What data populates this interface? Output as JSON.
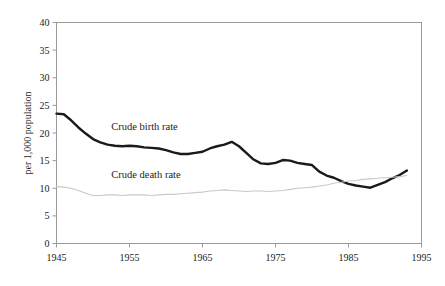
{
  "chart_data": {
    "type": "line",
    "title": "",
    "xlabel": "",
    "ylabel": "per 1,000 population",
    "xlim": [
      1945,
      1995
    ],
    "ylim": [
      0,
      40
    ],
    "grid": false,
    "legend_position": "inline-annotation",
    "x_ticks": [
      "1945",
      "1955",
      "1965",
      "1975",
      "1985",
      "1995"
    ],
    "x_tick_values": [
      1945,
      1955,
      1965,
      1975,
      1985,
      1995
    ],
    "y_ticks": [
      "0",
      "5",
      "10",
      "15",
      "20",
      "25",
      "30",
      "35",
      "40"
    ],
    "y_tick_values": [
      0,
      5,
      10,
      15,
      20,
      25,
      30,
      35,
      40
    ],
    "x": [
      1945,
      1946,
      1947,
      1948,
      1949,
      1950,
      1951,
      1952,
      1953,
      1954,
      1955,
      1956,
      1957,
      1958,
      1959,
      1960,
      1961,
      1962,
      1963,
      1964,
      1965,
      1966,
      1967,
      1968,
      1969,
      1970,
      1971,
      1972,
      1973,
      1974,
      1975,
      1976,
      1977,
      1978,
      1979,
      1980,
      1981,
      1982,
      1983,
      1984,
      1985,
      1986,
      1987,
      1988,
      1989,
      1990,
      1991,
      1992,
      1993
    ],
    "series": [
      {
        "name": "Crude birth rate",
        "color": "#1a1a1a",
        "width": 2.4,
        "label_x": 1952.5,
        "label_y": 20.6,
        "values": [
          23.5,
          23.4,
          22.3,
          21.0,
          19.9,
          18.9,
          18.3,
          17.9,
          17.7,
          17.6,
          17.7,
          17.6,
          17.4,
          17.3,
          17.2,
          16.9,
          16.5,
          16.2,
          16.2,
          16.4,
          16.6,
          17.2,
          17.6,
          17.9,
          18.4,
          17.6,
          16.4,
          15.2,
          14.5,
          14.4,
          14.6,
          15.1,
          15.0,
          14.6,
          14.4,
          14.2,
          13.0,
          12.3,
          11.9,
          11.3,
          10.8,
          10.5,
          10.3,
          10.1,
          10.6,
          11.1,
          11.8,
          12.4,
          13.2
        ]
      },
      {
        "name": "Crude death rate",
        "color": "#c9c9c9",
        "width": 1.1,
        "label_x": 1952.5,
        "label_y": 11.9,
        "values": [
          10.3,
          10.2,
          10.0,
          9.6,
          9.1,
          8.7,
          8.7,
          8.8,
          8.8,
          8.7,
          8.8,
          8.8,
          8.8,
          8.7,
          8.8,
          8.9,
          8.9,
          9.0,
          9.1,
          9.2,
          9.3,
          9.5,
          9.6,
          9.7,
          9.6,
          9.5,
          9.4,
          9.5,
          9.5,
          9.4,
          9.5,
          9.6,
          9.8,
          10.0,
          10.1,
          10.2,
          10.4,
          10.6,
          10.9,
          11.1,
          11.3,
          11.4,
          11.6,
          11.7,
          11.8,
          11.9,
          12.0,
          12.1,
          12.3
        ]
      }
    ]
  },
  "figure": {
    "background_color": "#ffffff",
    "frame_color": "#9a9a9a"
  }
}
